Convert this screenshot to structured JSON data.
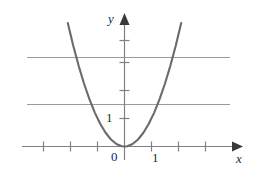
{
  "figure": {
    "name": "parabola-graph",
    "background_color": "#ffffff"
  },
  "labels": {
    "y_axis": "y",
    "x_axis": "x",
    "origin": "0",
    "x_unit": "1",
    "y_unit": "1"
  },
  "chart_data": {
    "type": "line",
    "title": "",
    "xlabel": "x",
    "ylabel": "y",
    "grid": true,
    "legend": null,
    "xlim": [
      -3.3,
      3.6
    ],
    "ylim": [
      -0.45,
      4.6
    ],
    "x_ticks": [
      -3,
      -2,
      -1,
      0,
      1,
      2,
      3
    ],
    "x_tick_labels": [
      "",
      "",
      "",
      "0",
      "1",
      "",
      ""
    ],
    "y_ticks": [
      1,
      2,
      3,
      4
    ],
    "y_tick_labels": [
      "1",
      "",
      "",
      ""
    ],
    "gridlines_horizontal": [
      1.75,
      3.4
    ],
    "series": [
      {
        "name": "y = x^2",
        "equation": "y = x^2",
        "color": "#6b6b6b",
        "x": [
          -2.1,
          -1.9,
          -1.7,
          -1.5,
          -1.3,
          -1.1,
          -0.9,
          -0.7,
          -0.5,
          -0.3,
          -0.1,
          0,
          0.1,
          0.3,
          0.5,
          0.7,
          0.9,
          1.1,
          1.3,
          1.5,
          1.7,
          1.9,
          2.1
        ],
        "values": [
          4.41,
          3.61,
          2.89,
          2.25,
          1.69,
          1.21,
          0.81,
          0.49,
          0.25,
          0.09,
          0.01,
          0,
          0.01,
          0.09,
          0.25,
          0.49,
          0.81,
          1.21,
          1.69,
          2.25,
          2.89,
          3.61,
          4.41
        ]
      }
    ],
    "colors": {
      "curve": "#6b6b6b",
      "axis": "#888888",
      "gridline": "#9a9a9a",
      "text": "#2b2b2b"
    }
  }
}
